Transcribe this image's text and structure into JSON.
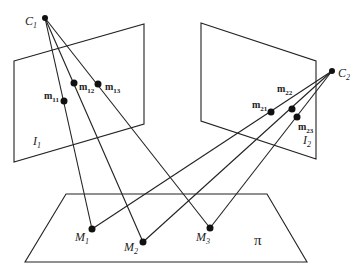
{
  "diagram": {
    "cameras": [
      {
        "id": "C1",
        "label": "C",
        "sub": "1"
      },
      {
        "id": "C2",
        "label": "C",
        "sub": "2"
      }
    ],
    "image_planes": [
      {
        "id": "I1",
        "label": "I",
        "sub": "1"
      },
      {
        "id": "I2",
        "label": "I",
        "sub": "2"
      }
    ],
    "image_points": [
      {
        "id": "m11",
        "label": "m",
        "sub": "11"
      },
      {
        "id": "m12",
        "label": "m",
        "sub": "12"
      },
      {
        "id": "m13",
        "label": "m",
        "sub": "13"
      },
      {
        "id": "m21",
        "label": "m",
        "sub": "21"
      },
      {
        "id": "m22",
        "label": "m",
        "sub": "22"
      },
      {
        "id": "m23",
        "label": "m",
        "sub": "23"
      }
    ],
    "world_points": [
      {
        "id": "M1",
        "label": "M",
        "sub": "1"
      },
      {
        "id": "M2",
        "label": "M",
        "sub": "2"
      },
      {
        "id": "M3",
        "label": "M",
        "sub": "3"
      }
    ],
    "world_plane": {
      "id": "pi",
      "label": "π"
    },
    "colors": {
      "line": "#222222",
      "background": "#ffffff"
    }
  }
}
